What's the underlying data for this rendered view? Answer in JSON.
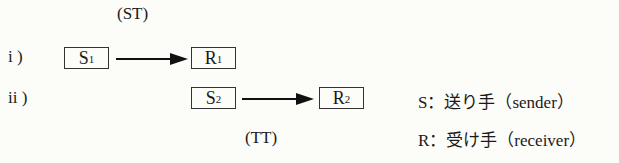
{
  "labels": {
    "st": "(ST)",
    "tt": "(TT)",
    "row1": "i )",
    "row2": "ii )"
  },
  "boxes": {
    "s1": {
      "main": "S",
      "sub": "1"
    },
    "r1": {
      "main": "R",
      "sub": "1"
    },
    "s2": {
      "main": "S",
      "sub": "2"
    },
    "r2": {
      "main": "R",
      "sub": "2"
    }
  },
  "legend": {
    "sender": "S：送り手（sender）",
    "receiver": "R：受け手（receiver）"
  }
}
